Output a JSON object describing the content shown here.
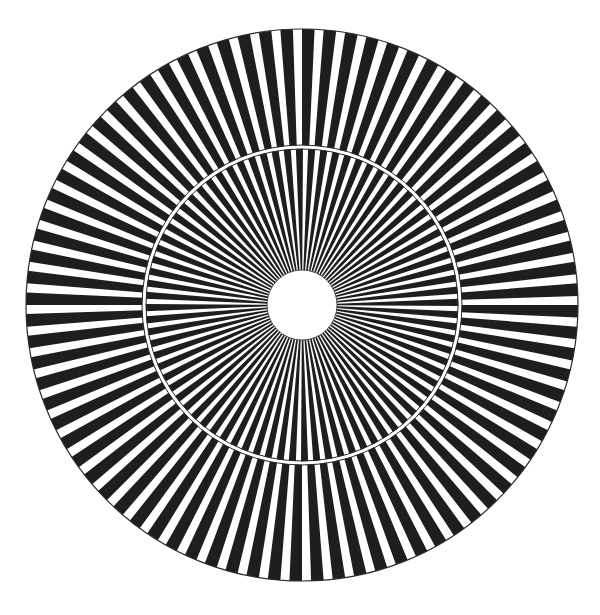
{
  "figure": {
    "type": "radial-spoke-pattern",
    "caption_clipped_text": "",
    "center": [
      302,
      305
    ],
    "outer_radius": 276,
    "middle_radius": 158,
    "inner_radius": 35,
    "spoke_count": 80,
    "black_fraction": 0.58,
    "inner_ring_phase_offset_fraction": 0.5,
    "ring_gap_width": 3,
    "colors": {
      "background": "#ffffff",
      "spoke": "#1e1e1e",
      "outline": "#2a2a2a"
    }
  }
}
